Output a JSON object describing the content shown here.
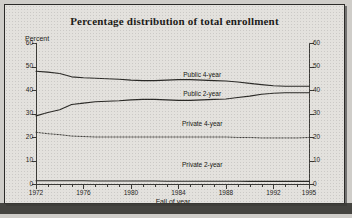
{
  "chart_data": {
    "type": "line",
    "title": "Percentage distribution of total enrollment",
    "xlabel": "Fall of year",
    "ylabel": "Percent",
    "ylabel_right": "",
    "xlim": [
      1972,
      1995
    ],
    "ylim": [
      0,
      60
    ],
    "ytick_values": [
      0,
      10,
      20,
      30,
      40,
      50,
      60
    ],
    "ytick_labels_left": [
      "0",
      "10",
      "20",
      "30",
      "40",
      "50",
      "60"
    ],
    "ytick_labels_right": [
      "0",
      "10",
      "20",
      "30",
      "40",
      "50",
      "60"
    ],
    "xtick_values": [
      1972,
      1976,
      1980,
      1984,
      1988,
      1992,
      1995
    ],
    "xtick_labels": [
      "1972",
      "1976",
      "1980",
      "1984",
      "1988",
      "1992",
      "1995"
    ],
    "grid": false,
    "legend": "inline-labels",
    "x": [
      1972,
      1973,
      1974,
      1975,
      1976,
      1977,
      1978,
      1979,
      1980,
      1981,
      1982,
      1983,
      1984,
      1985,
      1986,
      1987,
      1988,
      1989,
      1990,
      1991,
      1992,
      1993,
      1994,
      1995
    ],
    "series": [
      {
        "name": "Public 4-year",
        "style": "solid",
        "values": [
          48.0,
          47.6,
          47.0,
          45.6,
          45.2,
          45.0,
          44.8,
          44.6,
          44.2,
          44.0,
          44.0,
          44.2,
          44.4,
          44.4,
          44.2,
          44.0,
          43.8,
          43.4,
          42.8,
          42.3,
          41.8,
          41.6,
          41.6,
          41.6
        ]
      },
      {
        "name": "Public 2-year",
        "style": "solid",
        "values": [
          29.0,
          30.4,
          31.6,
          33.8,
          34.4,
          35.0,
          35.2,
          35.4,
          35.8,
          36.0,
          36.0,
          35.8,
          35.6,
          35.6,
          35.8,
          36.0,
          36.2,
          36.8,
          37.4,
          38.2,
          38.6,
          38.8,
          38.8,
          38.8
        ]
      },
      {
        "name": "Private 4-year",
        "style": "dotted",
        "values": [
          22.0,
          21.4,
          21.0,
          20.4,
          20.2,
          20.0,
          20.0,
          20.0,
          20.0,
          20.0,
          20.0,
          20.0,
          20.0,
          20.0,
          20.0,
          20.0,
          20.0,
          19.8,
          19.8,
          19.6,
          19.6,
          19.6,
          19.6,
          19.8
        ]
      },
      {
        "name": "Private 2-year",
        "style": "solid",
        "values": [
          1.4,
          1.4,
          1.4,
          1.4,
          1.4,
          1.3,
          1.3,
          1.3,
          1.3,
          1.3,
          1.3,
          1.2,
          1.2,
          1.2,
          1.2,
          1.2,
          1.2,
          1.2,
          1.1,
          1.1,
          1.1,
          1.1,
          1.1,
          1.1
        ]
      }
    ],
    "series_label_positions": [
      {
        "name": "Public 4-year",
        "x": 1986.0,
        "y": 46.5
      },
      {
        "name": "Public 2-year",
        "x": 1986.0,
        "y": 38.2
      },
      {
        "name": "Private 4-year",
        "x": 1986.0,
        "y": 25.5
      },
      {
        "name": "Private 2-year",
        "x": 1986.0,
        "y": 8.0
      }
    ]
  }
}
